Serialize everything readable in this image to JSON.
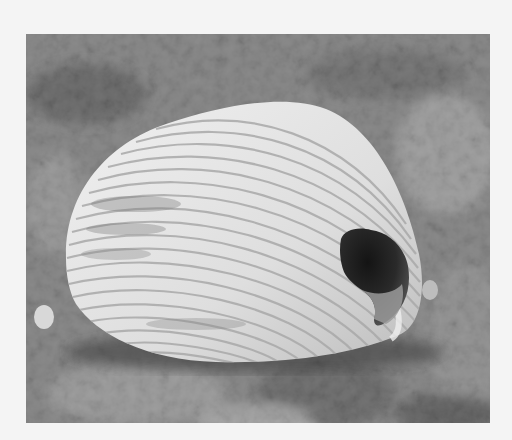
{
  "image": {
    "caption": "Grayscale photograph of a ribbed cockle seashell with a broken hole, lying on sandy ground",
    "subject": "cockle seashell",
    "background": "sand and grit",
    "colors": {
      "page_background": "#f4f4f4",
      "sand_mid": "#7d7d7d",
      "sand_dark": "#4a4a4a",
      "sand_light": "#b8b8b8",
      "shell_light": "#e6e6e6",
      "shell_rib_shadow": "#a9a9a9",
      "hole_dark": "#1e1e1e",
      "shell_interior": "#9a9a9a"
    }
  }
}
